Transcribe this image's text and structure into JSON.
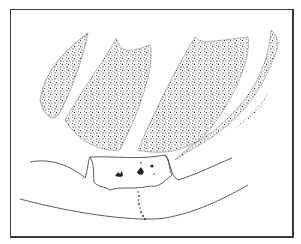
{
  "figure": {
    "colors": {
      "ink": "#2b2b2b",
      "stipple": "#555555",
      "background": "#ffffff",
      "frame": "#3a3a3a"
    },
    "stippled_regions": 5,
    "outlined_structures": [
      "left-curve",
      "central-block",
      "right-curve",
      "lower-arc"
    ]
  }
}
